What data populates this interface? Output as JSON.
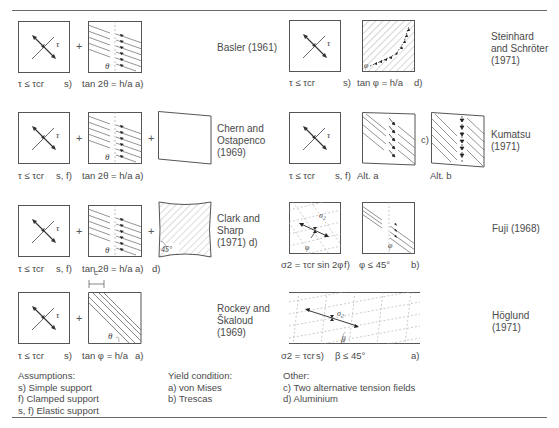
{
  "figure": {
    "rows": [
      {
        "id": "basler",
        "author": "Basler (1961)",
        "shear_condition": "τ ≤ τcr",
        "support": "s)",
        "field_formula": "tan 2θ = h/a",
        "yield": "a)",
        "angle_symbol": "θ",
        "stress_symbol": "τ"
      },
      {
        "id": "steinhard",
        "author": "Steinhard\nand Schröter\n(1971)",
        "shear_condition": "τ ≤ τcr",
        "support": "s)",
        "field_formula": "tan φ = h/a",
        "note": "d)",
        "angle_symbol": "φ",
        "stress_symbol": "τ"
      },
      {
        "id": "chern",
        "author": "Chern and\nOstapenco\n(1969)",
        "shear_condition": "τ ≤ τcr",
        "support": "s, f)",
        "field_formula": "tan 2θ = h/a",
        "yield": "a)",
        "angle_symbol": "θ",
        "stress_symbol": "τ"
      },
      {
        "id": "kumatsu",
        "author": "Kumatsu\n(1971)",
        "shear_condition": "τ ≤ τcr",
        "support": "s, f)",
        "alt_a": "Alt. a",
        "alt_b": "Alt. b",
        "note": "c)",
        "stress_symbol": "τ"
      },
      {
        "id": "clark",
        "author": "Clark and\nSharp\n(1971)   d)",
        "shear_condition": "τ ≤ τcr",
        "support": "s, f)",
        "field_formula": "tan 2θ = h/a",
        "yield": "a)",
        "note": "d)",
        "angle_symbol": "θ",
        "angle_label": "45°",
        "stress_symbol": "τ"
      },
      {
        "id": "fuji",
        "author": "Fuji (1968)",
        "shear_condition": "σ2 = τcr sin 2φ",
        "support": "f)",
        "field_formula": "φ ≤ 45°",
        "yield": "b)",
        "angle_symbol": "φ",
        "stress_symbol": "σ2"
      },
      {
        "id": "rockey",
        "author": "Rockey and\nŠkaloud\n(1969)",
        "shear_condition": "τ ≤ τcr",
        "support": "s)",
        "field_formula": "tan φ = h/a",
        "yield": "a)",
        "angle_symbol": "θ",
        "dim_symbol": "c",
        "stress_symbol": "τ"
      },
      {
        "id": "hoglund",
        "author": "Höglund\n(1971)",
        "shear_condition": "σ2 = τcr",
        "support": "s)",
        "field_formula": "β ≤ 45°",
        "yield": "a)",
        "angle_symbol": "β",
        "stress_symbol": "σ2"
      }
    ],
    "plus_sign": "+",
    "legend": {
      "assumptions": {
        "heading": "Assumptions:",
        "items": [
          "s)    Simple support",
          "f)    Clamped support",
          "s, f) Elastic support"
        ]
      },
      "yield_condition": {
        "heading": "Yield condition:",
        "items": [
          "a)  von Mises",
          "b)  Trescas"
        ]
      },
      "other": {
        "heading": "Other:",
        "items": [
          "c)  Two alternative tension fields",
          "d)  Aluminium"
        ]
      }
    }
  }
}
